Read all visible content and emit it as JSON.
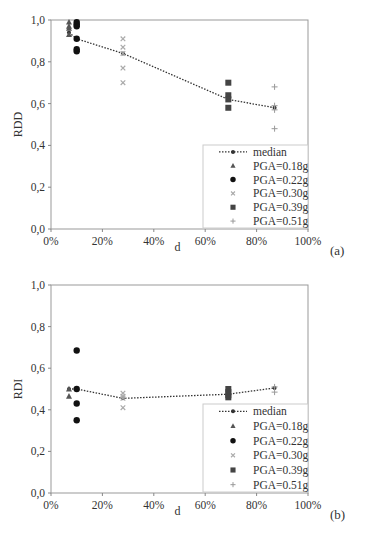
{
  "chart_data": [
    {
      "type": "scatter",
      "panel_label": "(a)",
      "title": "",
      "xlabel": "d",
      "ylabel": "RDD",
      "xlim": [
        0,
        100
      ],
      "ylim": [
        0.0,
        1.0
      ],
      "x_tick_labels": [
        "0%",
        "20%",
        "40%",
        "60%",
        "80%",
        "100%"
      ],
      "y_tick_labels": [
        "0,0",
        "0,2",
        "0,4",
        "0,6",
        "0,8",
        "1,0"
      ],
      "grid": false,
      "legend_position": "lower right",
      "legend": [
        "median",
        "PGA=0.18g",
        "PGA=0.22g",
        "PGA=0.30g",
        "PGA=0.39g",
        "PGA=0.51g"
      ],
      "series": [
        {
          "name": "median",
          "marker": "line-dot",
          "x": [
            7,
            10,
            28,
            69,
            87
          ],
          "y": [
            0.94,
            0.91,
            0.84,
            0.62,
            0.58
          ]
        },
        {
          "name": "PGA=0.18g",
          "marker": "triangle",
          "x": [
            7,
            7,
            7,
            7
          ],
          "y": [
            0.99,
            0.97,
            0.96,
            0.93
          ]
        },
        {
          "name": "PGA=0.22g",
          "marker": "circle",
          "x": [
            10,
            10,
            10,
            10,
            10,
            10
          ],
          "y": [
            0.99,
            0.98,
            0.97,
            0.91,
            0.86,
            0.85
          ]
        },
        {
          "name": "PGA=0.30g",
          "marker": "x",
          "x": [
            28,
            28,
            28,
            28,
            28
          ],
          "y": [
            0.91,
            0.87,
            0.84,
            0.77,
            0.7
          ]
        },
        {
          "name": "PGA=0.39g",
          "marker": "square",
          "x": [
            69,
            69,
            69,
            69
          ],
          "y": [
            0.7,
            0.64,
            0.62,
            0.58
          ]
        },
        {
          "name": "PGA=0.51g",
          "marker": "plus",
          "x": [
            87,
            87,
            87,
            87
          ],
          "y": [
            0.68,
            0.59,
            0.57,
            0.48
          ]
        }
      ]
    },
    {
      "type": "scatter",
      "panel_label": "(b)",
      "title": "",
      "xlabel": "d",
      "ylabel": "RDI",
      "xlim": [
        0,
        100
      ],
      "ylim": [
        0.0,
        1.0
      ],
      "x_tick_labels": [
        "0%",
        "20%",
        "40%",
        "60%",
        "80%",
        "100%"
      ],
      "y_tick_labels": [
        "0,0",
        "0,2",
        "0,4",
        "0,6",
        "0,8",
        "1,0"
      ],
      "grid": false,
      "legend_position": "lower right",
      "legend": [
        "median",
        "PGA=0.18g",
        "PGA=0.22g",
        "PGA=0.30g",
        "PGA=0.39g",
        "PGA=0.51g"
      ],
      "series": [
        {
          "name": "median",
          "marker": "line-dot",
          "x": [
            7,
            10,
            28,
            69,
            87
          ],
          "y": [
            0.5,
            0.5,
            0.455,
            0.475,
            0.505
          ]
        },
        {
          "name": "PGA=0.18g",
          "marker": "triangle",
          "x": [
            7,
            7
          ],
          "y": [
            0.5,
            0.465
          ]
        },
        {
          "name": "PGA=0.22g",
          "marker": "circle",
          "x": [
            10,
            10,
            10,
            10
          ],
          "y": [
            0.685,
            0.5,
            0.43,
            0.35
          ]
        },
        {
          "name": "PGA=0.30g",
          "marker": "x",
          "x": [
            28,
            28,
            28,
            28
          ],
          "y": [
            0.48,
            0.465,
            0.455,
            0.41
          ]
        },
        {
          "name": "PGA=0.39g",
          "marker": "square",
          "x": [
            69,
            69,
            69,
            69
          ],
          "y": [
            0.5,
            0.485,
            0.47,
            0.46
          ]
        },
        {
          "name": "PGA=0.51g",
          "marker": "plus",
          "x": [
            87,
            87
          ],
          "y": [
            0.51,
            0.485
          ]
        }
      ]
    }
  ],
  "colors": {
    "axis": "#888888",
    "frame": "#999999",
    "text": "#333333",
    "pga018": "#555555",
    "pga022": "#111111",
    "pga030": "#aaaaaa",
    "pga039": "#444444",
    "pga051": "#999999",
    "median": "#333333"
  }
}
